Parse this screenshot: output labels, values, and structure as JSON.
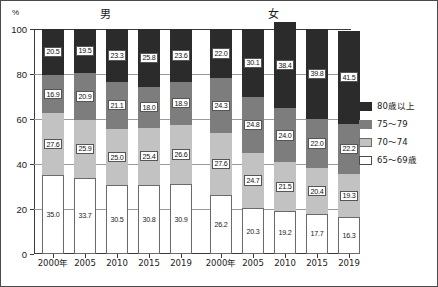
{
  "chart_data": {
    "type": "bar",
    "subtype": "stacked-100-percent",
    "title": "",
    "panels": [
      {
        "name": "male",
        "label": "男"
      },
      {
        "name": "female",
        "label": "女"
      }
    ],
    "categories": [
      "2000年",
      "2005",
      "2010",
      "2015",
      "2019"
    ],
    "xlabel": "",
    "ylabel": "%",
    "ylim": [
      0,
      100
    ],
    "yticks": [
      0,
      20,
      40,
      60,
      80,
      100
    ],
    "grid": true,
    "legend_position": "right",
    "legend": [
      "80歳以上",
      "75〜79",
      "70〜74",
      "65〜69歳"
    ],
    "colors": {
      "80歳以上": "#2b2b2b",
      "75〜79": "#7d7d7d",
      "70〜74": "#c2c2c2",
      "65〜69歳": "#ffffff"
    },
    "series": [
      {
        "name": "65〜69歳",
        "male": [
          35.0,
          33.7,
          30.5,
          30.8,
          30.9
        ],
        "female": [
          26.2,
          20.3,
          19.2,
          17.7,
          16.3
        ]
      },
      {
        "name": "70〜74",
        "male": [
          27.6,
          25.9,
          25.0,
          25.4,
          26.6
        ],
        "female": [
          27.6,
          24.7,
          21.5,
          20.4,
          19.3
        ]
      },
      {
        "name": "75〜79",
        "male": [
          16.9,
          20.9,
          21.1,
          18.0,
          18.9
        ],
        "female": [
          24.3,
          24.8,
          24.0,
          22.0,
          22.2
        ]
      },
      {
        "name": "80歳以上",
        "male": [
          20.5,
          19.5,
          23.3,
          25.8,
          23.6
        ],
        "female": [
          22.0,
          30.1,
          38.4,
          39.8,
          41.5
        ]
      }
    ]
  },
  "axes": {
    "y_unit": "%",
    "y_tick_labels": [
      "100",
      "80",
      "60",
      "40",
      "20",
      "0"
    ],
    "x_tick_labels_male": [
      "2000年",
      "2005",
      "2010",
      "2015",
      "2019"
    ],
    "x_tick_labels_female": [
      "2000年",
      "2005",
      "2010",
      "2015",
      "2019"
    ]
  },
  "legend": {
    "items": [
      {
        "label": "80歳以上",
        "color": "#2b2b2b"
      },
      {
        "label": "75〜79",
        "color": "#7d7d7d"
      },
      {
        "label": "70〜74",
        "color": "#c2c2c2"
      },
      {
        "label": "65〜69歳",
        "color": "#ffffff"
      }
    ]
  },
  "panel_titles": {
    "male": "男",
    "female": "女"
  }
}
